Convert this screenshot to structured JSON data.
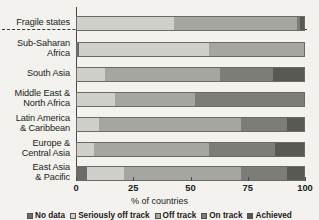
{
  "chart_data": {
    "type": "bar",
    "orientation": "horizontal",
    "stacked": true,
    "stack_unit": "percent",
    "title": "",
    "xlabel": "% of countries",
    "ylabel": "",
    "xlim": [
      0,
      100
    ],
    "xticks": [
      0,
      25,
      50,
      75,
      100
    ],
    "xticklabels": [
      "0",
      "25",
      "50",
      "75",
      "100"
    ],
    "grid": false,
    "legend_position": "bottom",
    "categories": [
      "Fragile states",
      "Sub-Saharan Africa",
      "South Asia",
      "Middle East & North Africa",
      "Latin America & Caribbean",
      "Europe & Central Asia",
      "East Asia & Pacific"
    ],
    "series": [
      {
        "name": "No data",
        "color": "#6b6b6b",
        "values": [
          0,
          1.5,
          0,
          0,
          0,
          0,
          5
        ]
      },
      {
        "name": "Seriously off track",
        "color": "#cfcfcb",
        "values": [
          43,
          56.5,
          12.5,
          17,
          10,
          8,
          16
        ]
      },
      {
        "name": "Off track",
        "color": "#a5a5a1",
        "values": [
          53.5,
          42,
          50.5,
          35,
          62,
          50,
          51
        ]
      },
      {
        "name": "On track",
        "color": "#7c7c78",
        "values": [
          1.5,
          0,
          23,
          48,
          20,
          29,
          20
        ]
      },
      {
        "name": "Achieved",
        "color": "#585855",
        "values": [
          2,
          0,
          14,
          0,
          8,
          13,
          8
        ]
      }
    ]
  },
  "legend": {
    "entries": [
      {
        "label": "No data",
        "color": "#6b6b6b"
      },
      {
        "label": "Seriously off track",
        "color": "#cfcfcb"
      },
      {
        "label": "Off track",
        "color": "#a5a5a1"
      },
      {
        "label": "On track",
        "color": "#7c7c78"
      },
      {
        "label": "Achieved",
        "color": "#585855"
      }
    ]
  },
  "axis": {
    "x_title": "% of countries"
  },
  "annotations": {
    "fragile_separator": true
  }
}
